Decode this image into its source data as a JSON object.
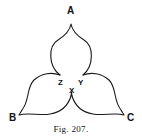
{
  "figure": {
    "caption": "Fig. 207.",
    "labels": {
      "A": "A",
      "B": "B",
      "C": "C",
      "X": "X",
      "Y": "Y",
      "Z": "Z"
    }
  }
}
